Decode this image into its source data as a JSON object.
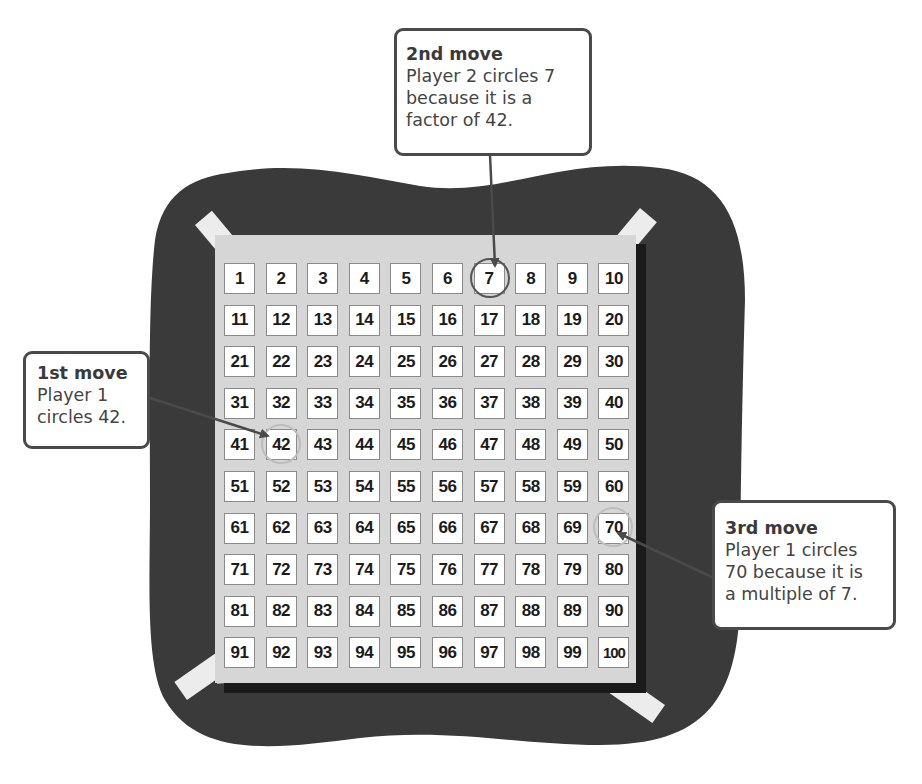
{
  "diagram": {
    "type": "hundred-chart-game",
    "grid": {
      "rows": 10,
      "cols": 10,
      "numbers": [
        1,
        2,
        3,
        4,
        5,
        6,
        7,
        8,
        9,
        10,
        11,
        12,
        13,
        14,
        15,
        16,
        17,
        18,
        19,
        20,
        21,
        22,
        23,
        24,
        25,
        26,
        27,
        28,
        29,
        30,
        31,
        32,
        33,
        34,
        35,
        36,
        37,
        38,
        39,
        40,
        41,
        42,
        43,
        44,
        45,
        46,
        47,
        48,
        49,
        50,
        51,
        52,
        53,
        54,
        55,
        56,
        57,
        58,
        59,
        60,
        61,
        62,
        63,
        64,
        65,
        66,
        67,
        68,
        69,
        70,
        71,
        72,
        73,
        74,
        75,
        76,
        77,
        78,
        79,
        80,
        81,
        82,
        83,
        84,
        85,
        86,
        87,
        88,
        89,
        90,
        91,
        92,
        93,
        94,
        95,
        96,
        97,
        98,
        99,
        100
      ],
      "circled": [
        7,
        42,
        70
      ]
    },
    "colors": {
      "background_blob": "#3a3a3a",
      "board": "#d6d6d6",
      "cell": "#ffffff",
      "tape": "#ececec",
      "tape_overlap": "#b3b3b3",
      "callout_border": "#4a4a4a",
      "arrow": "#4a4a4a",
      "circle_stroke": "#555555"
    }
  },
  "callouts": {
    "first": {
      "title": "1st move",
      "lines": [
        "Player 1",
        "circles 42."
      ],
      "target": 42
    },
    "second": {
      "title": "2nd move",
      "lines": [
        "Player 2 circles 7",
        "because it is a",
        "factor of 42."
      ],
      "target": 7
    },
    "third": {
      "title": "3rd move",
      "lines": [
        "Player 1 circles",
        "70 because it is",
        "a multiple of 7."
      ],
      "target": 70
    }
  }
}
